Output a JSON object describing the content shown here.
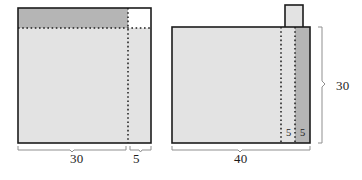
{
  "diagram": {
    "colors": {
      "light_fill": "#e3e3e3",
      "dark_fill": "#b5b5b5",
      "outline": "#1c1c1c",
      "dotted_line": "#1c1c1c",
      "bracket": "#8a8a8a",
      "white_fill": "#ffffff"
    },
    "figures": [
      {
        "name": "left-figure",
        "description": "Square sheet with shaded top band and dotted fold lines",
        "dimensions_bottom": [
          {
            "value": "30",
            "span": "main-width"
          },
          {
            "value": "5",
            "span": "flap-width"
          }
        ]
      },
      {
        "name": "right-figure",
        "description": "Rectangular sheet with a tab on top, shaded right band and two dotted fold lines",
        "dimensions_bottom": [
          {
            "value": "40",
            "span": "total-width"
          }
        ],
        "dimensions_right": [
          {
            "value": "30",
            "span": "total-height"
          }
        ],
        "dimensions_inner": [
          {
            "value": "5",
            "span": "inner-strip-1"
          },
          {
            "value": "5",
            "span": "inner-strip-2"
          }
        ]
      }
    ],
    "labels": {
      "left_width_main": "30",
      "left_width_flap": "5",
      "right_width_total": "40",
      "right_height_total": "30",
      "right_inner_a": "5",
      "right_inner_b": "5"
    }
  }
}
